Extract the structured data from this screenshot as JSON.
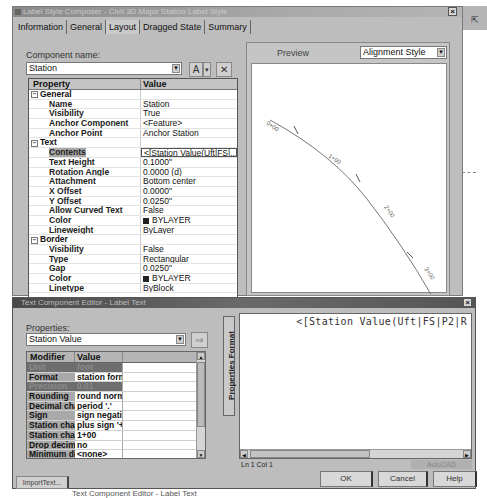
{
  "label_style_composer": {
    "title": "Label Style Composer - Civil 3D Major Station Label Style",
    "close_glyph": "×",
    "tabs": [
      {
        "label": "Information",
        "active": false
      },
      {
        "label": "General",
        "active": false
      },
      {
        "label": "Layout",
        "active": true
      },
      {
        "label": "Dragged State",
        "active": false
      },
      {
        "label": "Summary",
        "active": false
      }
    ],
    "component_name_label": "Component name:",
    "component_name_value": "Station",
    "toolbar": {
      "add_component_glyph": "A",
      "add_dropdown_glyph": "▾",
      "delete_glyph": "✕"
    },
    "grid": {
      "headers": {
        "property": "Property",
        "value": "Value"
      },
      "rows": [
        {
          "type": "group",
          "name": "General",
          "value": ""
        },
        {
          "type": "prop",
          "name": "Name",
          "value": "Station"
        },
        {
          "type": "prop",
          "name": "Visibility",
          "value": "True"
        },
        {
          "type": "prop",
          "name": "Anchor Component",
          "value": "<Feature>"
        },
        {
          "type": "prop",
          "name": "Anchor Point",
          "value": "Anchor Station"
        },
        {
          "type": "group",
          "name": "Text",
          "value": ""
        },
        {
          "type": "prop",
          "name": "Contents",
          "value": "<[Station Value(Uft|FS|...",
          "selected": true
        },
        {
          "type": "prop",
          "name": "Text Height",
          "value": "0.1000\""
        },
        {
          "type": "prop",
          "name": "Rotation Angle",
          "value": "0.0000 (d)"
        },
        {
          "type": "prop",
          "name": "Attachment",
          "value": "Bottom center"
        },
        {
          "type": "prop",
          "name": "X Offset",
          "value": "0.0000\""
        },
        {
          "type": "prop",
          "name": "Y Offset",
          "value": "0.0250\""
        },
        {
          "type": "prop",
          "name": "Allow Curved Text",
          "value": "False"
        },
        {
          "type": "prop",
          "name": "Color",
          "value": "BYLAYER",
          "swatch": "#222222"
        },
        {
          "type": "prop",
          "name": "Lineweight",
          "value": "ByLayer"
        },
        {
          "type": "group",
          "name": "Border",
          "value": ""
        },
        {
          "type": "prop",
          "name": "Visibility",
          "value": "False"
        },
        {
          "type": "prop",
          "name": "Type",
          "value": "Rectangular"
        },
        {
          "type": "prop",
          "name": "Gap",
          "value": "0.0250\""
        },
        {
          "type": "prop",
          "name": "Color",
          "value": "BYLAYER",
          "swatch": "#222222"
        },
        {
          "type": "prop",
          "name": "Linetype",
          "value": "ByBlock"
        }
      ]
    },
    "preview": {
      "label": "Preview",
      "style_select": "Alignment Style",
      "station_labels": [
        "0+00",
        "1+00",
        "2+00",
        "3+00"
      ]
    }
  },
  "text_component_editor": {
    "title": "Text Component Editor - Label Text",
    "close_glyph": "×",
    "properties_label": "Properties:",
    "properties_value": "Station Value",
    "insert_glyph": "⇨",
    "vertical_tab": "Properties  Format",
    "grid": {
      "headers": {
        "modifier": "Modifier",
        "value": "Value"
      },
      "rows": [
        {
          "modifier": "Unit",
          "value": "foot",
          "dim": true
        },
        {
          "modifier": "Format",
          "value": "station form"
        },
        {
          "modifier": "Precision",
          "value": "0.01",
          "dim": true
        },
        {
          "modifier": "Rounding",
          "value": "round norm"
        },
        {
          "modifier": "Decimal cha",
          "value": "period '.'"
        },
        {
          "modifier": "Sign",
          "value": "sign negativ"
        },
        {
          "modifier": "Station char",
          "value": "plus sign '+'"
        },
        {
          "modifier": "Station char",
          "value": "1+00"
        },
        {
          "modifier": "Drop decim",
          "value": "no"
        },
        {
          "modifier": "Minimum dis",
          "value": "<none>"
        }
      ]
    },
    "editor_text": "<[Station Value(Uft|FS|P2|R",
    "status_position": "Ln 1 Col 1",
    "status_font": "AutoCAD",
    "buttons": {
      "import": "ImportText...",
      "ok": "OK",
      "cancel": "Cancel",
      "help": "Help"
    }
  },
  "caption": "Text Component Editor - Label Text"
}
